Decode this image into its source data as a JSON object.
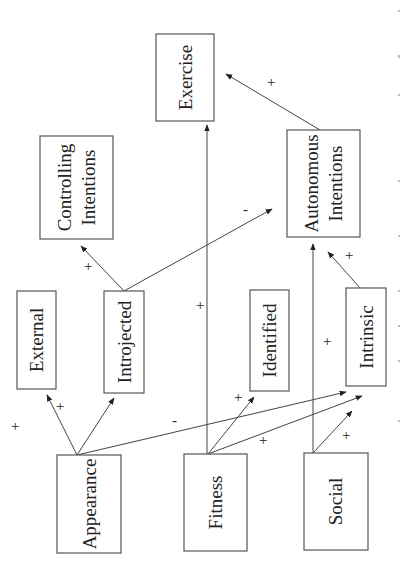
{
  "diagram": {
    "orientation": "rotated-90-ccw",
    "nodes": {
      "exercise": {
        "label": "Exercise"
      },
      "controlling": {
        "line1": "Controlling",
        "line2": "Intentions"
      },
      "autonomous": {
        "line1": "Autonomous",
        "line2": "Intentions"
      },
      "external": {
        "label": "External"
      },
      "introjected": {
        "label": "Introjected"
      },
      "identified": {
        "label": "Identified"
      },
      "intrinsic": {
        "label": "Intrinsic"
      },
      "appearance": {
        "label": "Appearance"
      },
      "fitness": {
        "label": "Fitness"
      },
      "social": {
        "label": "Social"
      }
    },
    "edges": [
      {
        "from": "Appearance",
        "to": "External",
        "sign": "+"
      },
      {
        "from": "Appearance",
        "to": "Introjected",
        "sign": "+"
      },
      {
        "from": "Appearance",
        "to": "Intrinsic",
        "sign": "-"
      },
      {
        "from": "Fitness",
        "to": "Exercise",
        "sign": "+"
      },
      {
        "from": "Fitness",
        "to": "Identified",
        "sign": "+"
      },
      {
        "from": "Fitness",
        "to": "Intrinsic",
        "sign": "+"
      },
      {
        "from": "Social",
        "to": "Autonomous Intentions",
        "sign": "+"
      },
      {
        "from": "Social",
        "to": "Intrinsic",
        "sign": "+"
      },
      {
        "from": "Introjected",
        "to": "Controlling Intentions",
        "sign": "+"
      },
      {
        "from": "Introjected",
        "to": "Autonomous Intentions",
        "sign": "-"
      },
      {
        "from": "Intrinsic",
        "to": "Autonomous Intentions",
        "sign": "+"
      },
      {
        "from": "Autonomous Intentions",
        "to": "Exercise",
        "sign": "+"
      }
    ],
    "signs": {
      "plus": "+",
      "minus": "-"
    }
  }
}
